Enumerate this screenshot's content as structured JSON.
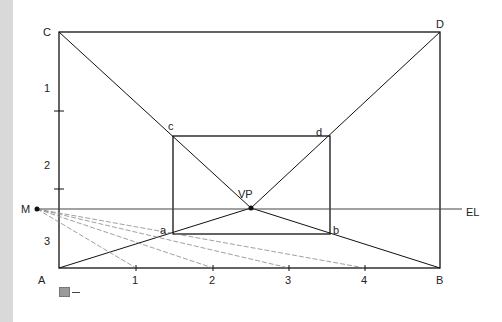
{
  "figure": {
    "caption": "圖一",
    "points": {
      "A": "A",
      "B": "B",
      "C": "C",
      "D": "D",
      "a": "a",
      "b": "b",
      "c": "c",
      "d": "d",
      "VP": "VP",
      "M": "M",
      "EL": "EL"
    },
    "base_ticks": [
      "1",
      "2",
      "3",
      "4"
    ],
    "left_ticks": [
      "1",
      "2",
      "3"
    ],
    "colors": {
      "line": "#111111",
      "dashed": "#888888",
      "strip": "#d9d9d9"
    }
  }
}
